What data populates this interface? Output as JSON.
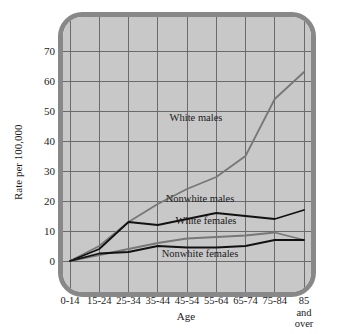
{
  "chart_data": {
    "type": "line",
    "title": "",
    "xlabel": "Age",
    "ylabel": "Rate per 100,000",
    "categories": [
      "0-14",
      "15-24",
      "25-34",
      "35-44",
      "45-54",
      "55-64",
      "65-74",
      "75-84",
      "85 and over"
    ],
    "xtick_labels": [
      "0-14",
      "15-24",
      "25-34",
      "35-44",
      "45-54",
      "55-64",
      "65-74",
      "75-84",
      "85"
    ],
    "xtick_last_extra_lines": [
      "and",
      "over"
    ],
    "ytick_labels": [
      "0",
      "10",
      "20",
      "30",
      "40",
      "50",
      "60",
      "70"
    ],
    "yticks": [
      0,
      10,
      20,
      30,
      40,
      50,
      60,
      70
    ],
    "ylim": [
      0,
      75
    ],
    "grid": true,
    "legend": "inline-annotations",
    "series": [
      {
        "name": "White males",
        "color": "#777777",
        "label_x_index": 4,
        "values": [
          0,
          5,
          13,
          19,
          24,
          28,
          35,
          54,
          63
        ]
      },
      {
        "name": "Nonwhite males",
        "color": "#111111",
        "label_x_index": 5,
        "values": [
          0,
          4,
          13,
          12,
          14,
          16,
          15,
          14,
          17
        ]
      },
      {
        "name": "White females",
        "color": "#777777",
        "label_x_index": 5,
        "values": [
          0,
          2,
          4,
          6,
          7.5,
          8,
          8.5,
          9.5,
          7
        ]
      },
      {
        "name": "Nonwhite females",
        "color": "#111111",
        "label_x_index": 5,
        "values": [
          0,
          2.5,
          3,
          5,
          4.5,
          4.5,
          5,
          7,
          7
        ]
      }
    ],
    "annotations": [
      {
        "text": "White males",
        "x": 196,
        "y": 121
      },
      {
        "text": "Nonwhite males",
        "x": 200,
        "y": 202
      },
      {
        "text": "White females",
        "x": 206,
        "y": 224
      },
      {
        "text": "Nonwhite females",
        "x": 200,
        "y": 257
      }
    ]
  },
  "colors": {
    "plot_background": "#c8c8c8",
    "frame": "#888888",
    "grid": "#6b6b6b",
    "dark_series": "#111111",
    "light_series": "#777777",
    "text": "#1a1a1a",
    "page_background": "#ffffff"
  }
}
